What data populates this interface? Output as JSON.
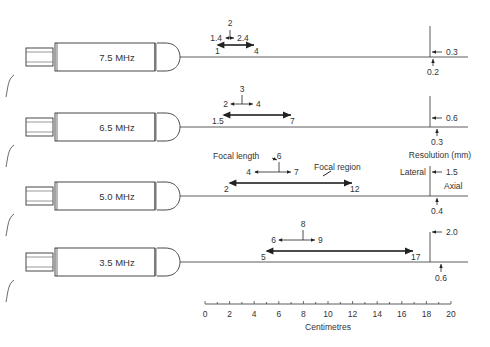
{
  "probes": [
    {
      "label": "7.5 MHz",
      "focal_length": "2",
      "fl_min": "1.4",
      "fl_max": "2.4",
      "region_start": "1",
      "region_end": "4",
      "lateral": "0.3",
      "axial": "0.2"
    },
    {
      "label": "6.5 MHz",
      "focal_length": "3",
      "fl_min": "2",
      "fl_max": "4",
      "region_start": "1.5",
      "region_end": "7",
      "lateral": "0.6",
      "axial": "0.3"
    },
    {
      "label": "5.0 MHz",
      "focal_length": "6",
      "fl_min": "4",
      "fl_max": "7",
      "region_start": "2",
      "region_end": "12",
      "lateral": "1.5",
      "axial": "0.4"
    },
    {
      "label": "3.5 MHz",
      "focal_length": "8",
      "fl_min": "6",
      "fl_max": "9",
      "region_start": "5",
      "region_end": "17",
      "lateral": "2.0",
      "axial": "0.6"
    }
  ],
  "annotations": {
    "focal_length": "Focal length",
    "focal_region": "Focal region",
    "resolution": "Resolution (mm)",
    "lateral": "Lateral",
    "axial": "Axial"
  },
  "axis": {
    "label": "Centimetres",
    "ticks": [
      "0",
      "2",
      "4",
      "6",
      "8",
      "10",
      "12",
      "14",
      "16",
      "18",
      "20"
    ]
  }
}
